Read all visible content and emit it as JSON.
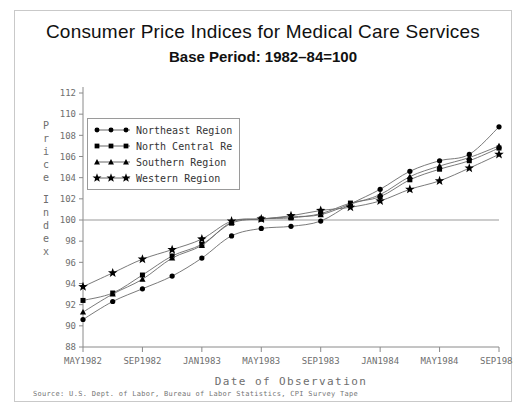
{
  "titles": {
    "main": "Consumer Price Indices for Medical Care Services",
    "sub": "Base Period: 1982–84=100"
  },
  "source_note": "Source: U.S. Dept. of Labor, Bureau of Labor Statistics, CPI Survey Tape",
  "ylabel_letters": [
    "P",
    "r",
    "i",
    "c",
    "e",
    "",
    "I",
    "n",
    "d",
    "e",
    "x"
  ],
  "legend": {
    "items": [
      {
        "label": "Northeast Region",
        "marker": "circle",
        "color": "#000000"
      },
      {
        "label": "North Central Re",
        "marker": "square",
        "color": "#000000"
      },
      {
        "label": "Southern Region",
        "marker": "triangle",
        "color": "#000000"
      },
      {
        "label": "Western Region",
        "marker": "star",
        "color": "#000000"
      }
    ]
  },
  "chart_data": {
    "type": "line",
    "title": "Consumer Price Indices for Medical Care Services",
    "subtitle": "Base Period: 1982–84=100",
    "xlabel": "Date of Observation",
    "ylabel": "Price Index",
    "ylim": [
      88,
      112
    ],
    "yticks": [
      88,
      90,
      92,
      94,
      96,
      98,
      100,
      102,
      104,
      106,
      108,
      110,
      112
    ],
    "xticklabels": [
      "MAY1982",
      "SEP1982",
      "JAN1983",
      "MAY1983",
      "SEP1983",
      "JAN1984",
      "MAY1984",
      "SEP1984"
    ],
    "grid": false,
    "reference_line": {
      "value": 100,
      "orientation": "horizontal",
      "color": "#999999"
    },
    "legend_position": "upper-left",
    "x": [
      "MAY1982",
      "JUL1982",
      "SEP1982",
      "NOV1982",
      "JAN1983",
      "MAR1983",
      "MAY1983",
      "JUL1983",
      "SEP1983",
      "NOV1983",
      "JAN1984",
      "MAR1984",
      "MAY1984",
      "JUL1984",
      "SEP1984"
    ],
    "series": [
      {
        "name": "Northeast Region",
        "marker": "circle",
        "values": [
          90.6,
          92.3,
          93.5,
          94.7,
          96.4,
          98.5,
          99.2,
          99.4,
          99.9,
          101.5,
          102.9,
          104.6,
          105.6,
          106.2,
          108.8
        ]
      },
      {
        "name": "North Central Re",
        "marker": "square",
        "values": [
          92.4,
          93.1,
          94.8,
          96.6,
          97.7,
          99.7,
          100.1,
          100.2,
          100.6,
          101.6,
          102.2,
          103.8,
          104.8,
          105.6,
          106.8
        ]
      },
      {
        "name": "Southern Region",
        "marker": "triangle",
        "values": [
          91.3,
          93.0,
          94.4,
          96.4,
          97.6,
          99.8,
          100.1,
          100.3,
          100.5,
          101.5,
          102.4,
          104.1,
          105.1,
          105.9,
          107.0
        ]
      },
      {
        "name": "Western Region",
        "marker": "star",
        "values": [
          93.7,
          95.0,
          96.3,
          97.2,
          98.2,
          99.9,
          100.1,
          100.4,
          100.9,
          101.2,
          101.8,
          102.9,
          103.7,
          104.9,
          106.2
        ]
      }
    ]
  }
}
